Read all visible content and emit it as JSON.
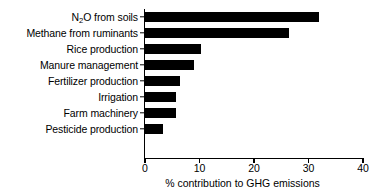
{
  "chart_data": {
    "type": "bar",
    "orientation": "horizontal",
    "title": "",
    "xlabel": "% contribution to GHG emissions",
    "ylabel": "",
    "xlim": [
      0,
      40
    ],
    "xticks": [
      0,
      10,
      20,
      30,
      40
    ],
    "xtick_labels": [
      "0",
      "10",
      "20",
      "30",
      "40"
    ],
    "grid": false,
    "legend": null,
    "bar_color": "#000000",
    "background_color": "#ffffff",
    "categories": [
      "N₂O from soils",
      "Methane from ruminants",
      "Rice production",
      "Manure management",
      "Fertilizer production",
      "Irrigation",
      "Farm machinery",
      "Pesticide production"
    ],
    "values": [
      31.9,
      26.5,
      10.3,
      9.0,
      6.5,
      5.7,
      5.7,
      3.3
    ],
    "points": [
      {
        "category": "N₂O from soils",
        "label_html": "N<sub>2</sub>O from soils",
        "value": 31.9
      },
      {
        "category": "Methane from ruminants",
        "label_html": "Methane from ruminants",
        "value": 26.5
      },
      {
        "category": "Rice production",
        "label_html": "Rice production",
        "value": 10.3
      },
      {
        "category": "Manure management",
        "label_html": "Manure management",
        "value": 9.0
      },
      {
        "category": "Fertilizer production",
        "label_html": "Fertilizer production",
        "value": 6.5
      },
      {
        "category": "Irrigation",
        "label_html": "Irrigation",
        "value": 5.7
      },
      {
        "category": "Farm machinery",
        "label_html": "Farm machinery",
        "value": 5.7
      },
      {
        "category": "Pesticide production",
        "label_html": "Pesticide production",
        "value": 3.3
      }
    ]
  }
}
